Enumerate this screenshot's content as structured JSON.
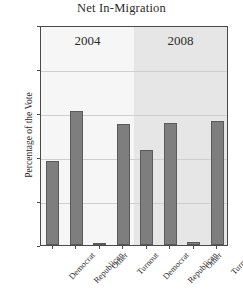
{
  "chart_data": {
    "type": "bar",
    "title": "Net In-Migration",
    "xlabel": "",
    "ylabel": "Percentage of the Vote",
    "ylim": [
      0,
      100
    ],
    "yticks": [
      0,
      20,
      40,
      60,
      80,
      100
    ],
    "grid": true,
    "legend": "none",
    "categories": [
      "Democrat",
      "Republican",
      "Other",
      "Turnout"
    ],
    "groups": [
      {
        "name": "2004",
        "label": "2004",
        "values": [
          38,
          61,
          1,
          55
        ]
      },
      {
        "name": "2008",
        "label": "2008",
        "values": [
          43,
          55.5,
          1.5,
          56.5
        ]
      }
    ],
    "bars": [
      {
        "group": "2004",
        "category": "Democrat",
        "value": 38
      },
      {
        "group": "2004",
        "category": "Republican",
        "value": 61
      },
      {
        "group": "2004",
        "category": "Other",
        "value": 1
      },
      {
        "group": "2004",
        "category": "Turnout",
        "value": 55
      },
      {
        "group": "2008",
        "category": "Democrat",
        "value": 43
      },
      {
        "group": "2008",
        "category": "Republican",
        "value": 55.5
      },
      {
        "group": "2008",
        "category": "Other",
        "value": 1.5
      },
      {
        "group": "2008",
        "category": "Turnout",
        "value": 56.5
      }
    ],
    "colors": {
      "bar_fill": "#7e7e7e",
      "bar_stroke": "#5a5a5a",
      "panel_left": "#f6f6f6",
      "panel_right": "#e6e6e6",
      "gridline": "#cfcfcf",
      "axis": "#4a4a4a",
      "text": "#2b2b2b",
      "background": "#ffffff"
    }
  }
}
